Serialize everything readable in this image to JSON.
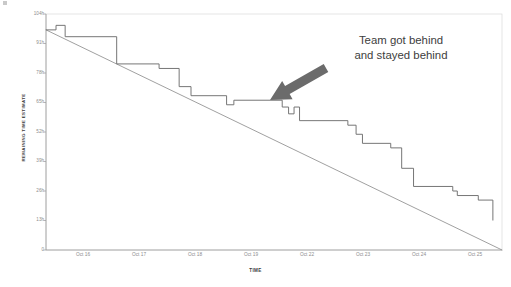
{
  "chart_data": {
    "type": "line",
    "title": "",
    "subtitle": "",
    "xlabel": "TIME",
    "ylabel": "REMAINING TIME ESTIMATE",
    "grid": false,
    "legend_position": "none",
    "ylim": [
      0,
      104
    ],
    "ytick_labels": [
      "104h",
      "91h",
      "78h",
      "65h",
      "52h",
      "39h",
      "26h",
      "13h",
      "0"
    ],
    "ytick_values": [
      104,
      91,
      78,
      65,
      52,
      39,
      26,
      13,
      0
    ],
    "xtick_labels": [
      "Oct 16",
      "Oct 17",
      "Oct 18",
      "Oct 19",
      "Oct 22",
      "Oct 23",
      "Oct 24",
      "Oct 25"
    ],
    "series": [
      {
        "name": "Ideal burndown",
        "style": "straight-line",
        "color": "#8f8f8f",
        "points": [
          {
            "x": 0.0,
            "y": 97
          },
          {
            "x": 10.0,
            "y": 0
          }
        ]
      },
      {
        "name": "Remaining time estimate (actual)",
        "style": "step",
        "color": "#6f6f6f",
        "points": [
          {
            "x": 0.0,
            "y": 97
          },
          {
            "x": 0.22,
            "y": 97
          },
          {
            "x": 0.22,
            "y": 99
          },
          {
            "x": 0.42,
            "y": 99
          },
          {
            "x": 0.42,
            "y": 94
          },
          {
            "x": 1.55,
            "y": 94
          },
          {
            "x": 1.55,
            "y": 82
          },
          {
            "x": 2.48,
            "y": 82
          },
          {
            "x": 2.48,
            "y": 80
          },
          {
            "x": 2.92,
            "y": 80
          },
          {
            "x": 2.92,
            "y": 72
          },
          {
            "x": 3.18,
            "y": 72
          },
          {
            "x": 3.18,
            "y": 68
          },
          {
            "x": 3.96,
            "y": 68
          },
          {
            "x": 3.96,
            "y": 64
          },
          {
            "x": 4.12,
            "y": 64
          },
          {
            "x": 4.12,
            "y": 66
          },
          {
            "x": 5.18,
            "y": 66
          },
          {
            "x": 5.18,
            "y": 63
          },
          {
            "x": 5.32,
            "y": 63
          },
          {
            "x": 5.32,
            "y": 60
          },
          {
            "x": 5.44,
            "y": 60
          },
          {
            "x": 5.44,
            "y": 63
          },
          {
            "x": 5.56,
            "y": 63
          },
          {
            "x": 5.56,
            "y": 57
          },
          {
            "x": 6.62,
            "y": 57
          },
          {
            "x": 6.62,
            "y": 55
          },
          {
            "x": 6.8,
            "y": 55
          },
          {
            "x": 6.8,
            "y": 51
          },
          {
            "x": 6.94,
            "y": 51
          },
          {
            "x": 6.94,
            "y": 47
          },
          {
            "x": 7.56,
            "y": 47
          },
          {
            "x": 7.56,
            "y": 45
          },
          {
            "x": 7.8,
            "y": 45
          },
          {
            "x": 7.8,
            "y": 36
          },
          {
            "x": 8.06,
            "y": 36
          },
          {
            "x": 8.06,
            "y": 28
          },
          {
            "x": 8.92,
            "y": 28
          },
          {
            "x": 8.92,
            "y": 26
          },
          {
            "x": 9.02,
            "y": 26
          },
          {
            "x": 9.02,
            "y": 24
          },
          {
            "x": 9.48,
            "y": 24
          },
          {
            "x": 9.48,
            "y": 22
          },
          {
            "x": 9.8,
            "y": 22
          },
          {
            "x": 9.8,
            "y": 13
          }
        ]
      }
    ],
    "annotations": [
      {
        "name": "behind-schedule-callout",
        "line1": "Team got behind",
        "line2": "and stayed behind",
        "color": "#3d3d3d",
        "arrow": {
          "name": "callout-arrow",
          "color": "#6b6b6b",
          "from_x": 326,
          "from_y": 68,
          "to_x": 270,
          "to_y": 100
        }
      }
    ],
    "colors": {
      "plot_border": "#d6d6d6",
      "axis": "#9a9a9a",
      "tick_label": "#8d8d8d",
      "axis_title": "#3a3a3a",
      "ideal_line": "#8f8f8f",
      "actual_line": "#6f6f6f",
      "arrow": "#6b6b6b",
      "annotation_text": "#3d3d3d",
      "background": "#ffffff"
    }
  }
}
